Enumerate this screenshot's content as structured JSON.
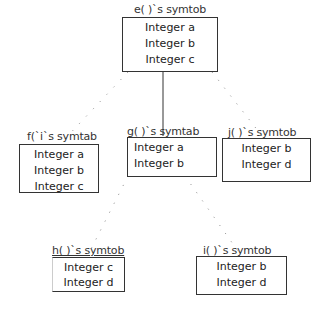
{
  "diagram": {
    "type": "tree",
    "nodes": {
      "e": {
        "title": "e( )`s symtob",
        "rows": [
          "Integer a",
          "Integer b",
          "Integer c"
        ]
      },
      "f": {
        "title": "f(`i`s symtab",
        "rows": [
          "Integer a",
          "Integer b",
          "Integer c"
        ]
      },
      "g": {
        "title": "g( )`s symtab",
        "rows": [
          "Integer a",
          "Integer b"
        ]
      },
      "j": {
        "title": "j( )`s symtob",
        "rows": [
          "Integer b",
          "Integer d"
        ]
      },
      "h": {
        "title": "h( )`s symtob",
        "rows": [
          "Integer c",
          "Integer d"
        ]
      },
      "i": {
        "title": "i( )`s symtob",
        "rows": [
          "Integer b",
          "Integer d"
        ]
      }
    },
    "edges": [
      {
        "from": "e",
        "to": "f",
        "style": "dotted"
      },
      {
        "from": "e",
        "to": "g",
        "style": "solid"
      },
      {
        "from": "e",
        "to": "j",
        "style": "dotted"
      },
      {
        "from": "g",
        "to": "h",
        "style": "dotted"
      },
      {
        "from": "g",
        "to": "i",
        "style": "dotted"
      }
    ],
    "colors": {
      "line": "#333333",
      "background": "#ffffff"
    }
  }
}
